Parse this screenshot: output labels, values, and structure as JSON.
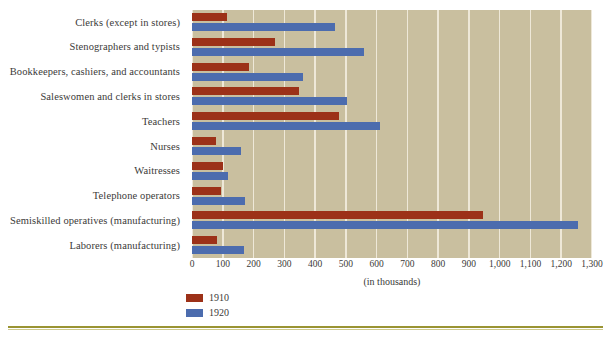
{
  "chart_data": {
    "type": "bar",
    "orientation": "horizontal",
    "title": "",
    "xlabel": "(in thousands)",
    "ylabel": "",
    "xlim": [
      0,
      1300
    ],
    "xticks": [
      "0",
      "100",
      "200",
      "300",
      "400",
      "500",
      "600",
      "700",
      "800",
      "900",
      "1,000",
      "1,100",
      "1,200",
      "1,300"
    ],
    "xtick_values": [
      0,
      100,
      200,
      300,
      400,
      500,
      600,
      700,
      800,
      900,
      1000,
      1100,
      1200,
      1300
    ],
    "grid": true,
    "legend_position": "bottom-left",
    "categories": [
      "Clerks (except in stores)",
      "Stenographers and typists",
      "Bookkeepers, cashiers, and accountants",
      "Saleswomen and clerks in stores",
      "Teachers",
      "Nurses",
      "Waitresses",
      "Telephone operators",
      "Semiskilled operatives (manufacturing)",
      "Laborers (manufacturing)"
    ],
    "series": [
      {
        "name": "1910",
        "color": "#9c3118",
        "values": [
          115,
          270,
          185,
          348,
          478,
          78,
          100,
          95,
          945,
          80
        ]
      },
      {
        "name": "1920",
        "color": "#4c6cae",
        "values": [
          465,
          560,
          360,
          505,
          610,
          158,
          118,
          172,
          1255,
          170
        ]
      }
    ]
  },
  "legend": {
    "items": [
      {
        "label": "1910",
        "color": "#9c3118"
      },
      {
        "label": "1920",
        "color": "#4c6cae"
      }
    ]
  },
  "style": {
    "plot_background": "#c9bf9f",
    "gridline_color": "#eee8d8",
    "page_background": "#ffffff",
    "rule_color": "#9a9433"
  }
}
